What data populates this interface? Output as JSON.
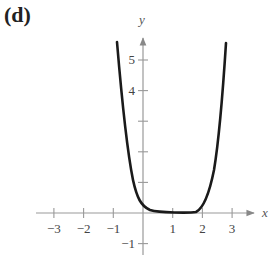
{
  "panel_label": "(d)",
  "chart_data": {
    "type": "line",
    "title": "",
    "xlabel": "x",
    "ylabel": "y",
    "xlim": [
      -3.5,
      4
    ],
    "ylim": [
      -1.3,
      5.8
    ],
    "grid": false,
    "x_ticks": [
      -3,
      -2,
      -1,
      1,
      2,
      3
    ],
    "x_tick_labels": [
      "−3",
      "−2",
      "−1",
      "1",
      "2",
      "3"
    ],
    "y_ticks": [
      -1,
      1,
      2,
      3,
      4,
      5
    ],
    "y_tick_labels": [
      "−1",
      "",
      "",
      "",
      "4",
      "5"
    ],
    "series": [
      {
        "name": "curve",
        "x": [
          -0.88,
          -0.75,
          -0.55,
          -0.32,
          0,
          0.4,
          1,
          1.6,
          2,
          2.25,
          2.5,
          2.8
        ],
        "y": [
          5.6,
          4.0,
          2.0,
          1.0,
          0.25,
          0.02,
          0,
          0.02,
          0.6,
          1.5,
          3.0,
          5.5
        ]
      }
    ]
  }
}
